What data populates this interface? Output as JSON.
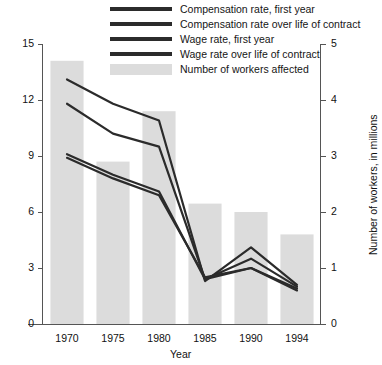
{
  "chart_data": {
    "type": "bar",
    "title": "",
    "subtitle": "",
    "xlabel": "Year",
    "ylabel": "Rate, percent",
    "y2label": "Number of workers, in millions",
    "categories": [
      "1970",
      "1975",
      "1980",
      "1985",
      "1990",
      "1994"
    ],
    "x": [
      1970,
      1975,
      1980,
      1985,
      1990,
      1994
    ],
    "ylim": [
      0,
      15
    ],
    "y2lim": [
      0,
      5
    ],
    "yticks": [
      0,
      3,
      6,
      9,
      12,
      15
    ],
    "y2ticks": [
      0,
      1,
      2,
      3,
      4,
      5
    ],
    "grid": false,
    "legend_position": "top",
    "bar_series": {
      "name": "Number of workers affected",
      "axis": "right",
      "unit": "millions",
      "color": "#dcdcdc",
      "values": [
        4.7,
        2.9,
        3.8,
        2.15,
        2.0,
        1.6
      ]
    },
    "series": [
      {
        "name": "Compensation rate, first year",
        "axis": "left",
        "unit": "percent",
        "color": "#2b2b2b",
        "values": [
          13.1,
          11.8,
          10.9,
          2.3,
          4.1,
          2.1
        ]
      },
      {
        "name": "Compensation rate over life of contract",
        "axis": "left",
        "unit": "percent",
        "color": "#2b2b2b",
        "values": [
          11.8,
          10.2,
          9.5,
          2.4,
          3.5,
          2.0
        ]
      },
      {
        "name": "Wage rate, first year",
        "axis": "left",
        "unit": "percent",
        "color": "#2b2b2b",
        "values": [
          9.1,
          8.0,
          7.1,
          2.4,
          3.0,
          1.9
        ]
      },
      {
        "name": "Wage rate over life of contract",
        "axis": "left",
        "unit": "percent",
        "color": "#2b2b2b",
        "values": [
          8.9,
          7.8,
          6.9,
          2.5,
          3.0,
          1.8
        ]
      }
    ]
  },
  "legend": {
    "items": [
      {
        "label": "Compensation rate, first year",
        "type": "line"
      },
      {
        "label": "Compensation rate over life of contract",
        "type": "line"
      },
      {
        "label": "Wage rate, first year",
        "type": "line"
      },
      {
        "label": "Wage rate over life of contract",
        "type": "line"
      },
      {
        "label": "Number of workers affected",
        "type": "bar"
      }
    ]
  },
  "axes": {
    "left": {
      "title": "Rate, percent",
      "ticks": [
        "15",
        "12",
        "9",
        "6",
        "3",
        "0"
      ]
    },
    "right": {
      "title": "Number of workers, in millions",
      "ticks": [
        "5",
        "4",
        "3",
        "2",
        "1",
        "0"
      ]
    },
    "bottom": {
      "title": "Year",
      "ticks": [
        "1970",
        "1975",
        "1980",
        "1985",
        "1990",
        "1994"
      ]
    }
  },
  "colors": {
    "bar": "#dcdcdc",
    "line": "#2b2b2b",
    "axis": "#555555",
    "text": "#111111",
    "background": "#ffffff"
  }
}
